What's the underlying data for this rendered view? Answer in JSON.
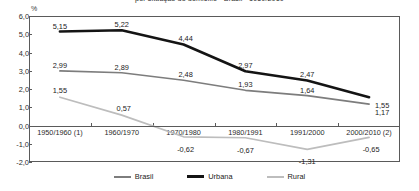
{
  "chart_data": {
    "type": "line",
    "title": "por situação do domicílio - Brasil - 1950/2010",
    "unit_label": "%",
    "xlabel": "",
    "ylabel": "",
    "grid": false,
    "legend_position": "bottom",
    "ylim": [
      -2.0,
      6.0
    ],
    "categories": [
      "1950/1960 (1)",
      "1960/1970",
      "1970/1980",
      "1980/1991",
      "1991/2000",
      "2000/2010 (2)"
    ],
    "y_ticks": [
      "6,0",
      "5,0",
      "4,0",
      "3,0",
      "2,0",
      "1,0",
      "0,0",
      "-1,0",
      "-2,0"
    ],
    "y_tick_values": [
      6.0,
      5.0,
      4.0,
      3.0,
      2.0,
      1.0,
      0.0,
      -1.0,
      -2.0
    ],
    "series": [
      {
        "name": "Brasil",
        "color": "#7d7d7d",
        "width": 1.7,
        "values": [
          2.99,
          2.89,
          2.48,
          1.93,
          1.64,
          1.17
        ],
        "labels": [
          "2,99",
          "2,89",
          "2,48",
          "1,93",
          "1,64",
          "1,17"
        ]
      },
      {
        "name": "Urbana",
        "color": "#141414",
        "width": 2.6,
        "values": [
          5.15,
          5.22,
          4.44,
          2.97,
          2.47,
          1.55
        ],
        "labels": [
          "5,15",
          "5,22",
          "4,44",
          "2,97",
          "2,47",
          "1,55"
        ]
      },
      {
        "name": "Rural",
        "color": "#bdbdbd",
        "width": 1.7,
        "values": [
          1.55,
          0.57,
          -0.62,
          -0.67,
          -1.31,
          -0.65
        ],
        "labels": [
          "1,55",
          "0,57",
          "-0,62",
          "-0,67",
          "-1,31",
          "-0,65"
        ]
      }
    ]
  }
}
